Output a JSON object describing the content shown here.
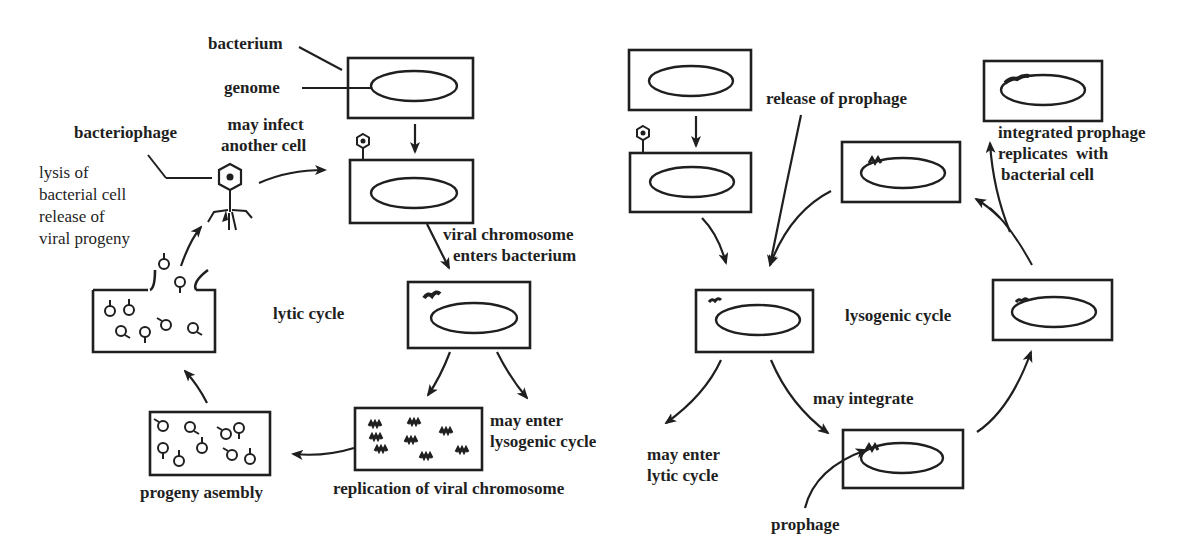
{
  "diagram": {
    "lytic": {
      "cycle_label": "lytic cycle",
      "labels": {
        "bacterium": "bacterium",
        "genome": "genome",
        "bacteriophage": "bacteriophage",
        "may_infect_1": "may infect",
        "may_infect_2": "another cell",
        "lysis_1": "lysis of",
        "lysis_2": "bacterial cell",
        "lysis_3": "release of",
        "lysis_4": "viral progeny",
        "viral_enters_1": "viral chromosome",
        "viral_enters_2": "enters bacterium",
        "may_enter_lyso_1": "may enter",
        "may_enter_lyso_2": "lysogenic cycle",
        "replication": "replication of viral chromosome",
        "progeny_assembly": "progeny asembly"
      },
      "stages": [
        "bacterium with genome",
        "phage attaches",
        "viral chromosome enters bacterium",
        "replication of viral chromosome",
        "progeny asembly",
        "lysis of bacterial cell, release of viral progeny"
      ]
    },
    "lysogenic": {
      "cycle_label": "lysogenic cycle",
      "labels": {
        "release_prophage": "release of prophage",
        "integrated_1": "integrated prophage",
        "integrated_2": "replicates  with",
        "integrated_3": "bacterial cell",
        "may_enter_lytic_1": "may enter",
        "may_enter_lytic_2": "lytic cycle",
        "may_integrate": "may integrate",
        "prophage": "prophage"
      },
      "stages": [
        "bacterium with genome",
        "phage attaches",
        "viral chromosome in cell",
        "prophage integrates",
        "integrated prophage replicates with bacterial cell",
        "release of prophage"
      ]
    }
  }
}
